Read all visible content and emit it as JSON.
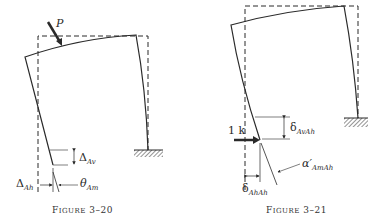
{
  "figures": [
    {
      "id": "fig-3-20",
      "caption": {
        "first": "F",
        "rest": "IGURE",
        "number": "3–20"
      },
      "load_label": "P",
      "labels": {
        "delta_av": {
          "symbol": "Δ",
          "sub": "Av"
        },
        "delta_ah": {
          "symbol": "Δ",
          "sub": "Ah"
        },
        "theta_am": {
          "symbol": "θ",
          "sub": "Am"
        }
      }
    },
    {
      "id": "fig-3-21",
      "caption": {
        "first": "F",
        "rest": "IGURE",
        "number": "3–21"
      },
      "load_label": "1 k",
      "labels": {
        "delta_avah": {
          "symbol": "δ",
          "sub": "AvAh"
        },
        "delta_ahah": {
          "symbol": "δ",
          "sub": "AhAh"
        },
        "alpha_amah": {
          "symbol": "α′",
          "sub": "AmAh"
        }
      }
    }
  ],
  "colors": {
    "ink": "#2a2a2a",
    "background": "#ffffff"
  }
}
